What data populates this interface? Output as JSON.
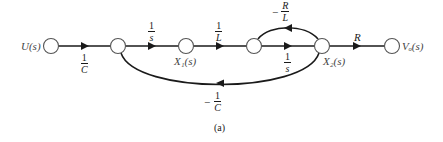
{
  "diagram": {
    "type": "signal-flow-graph",
    "caption": "(a)",
    "nodes": [
      {
        "id": "U",
        "label": "U(s)",
        "x": 51,
        "y": 46
      },
      {
        "id": "n2",
        "label": "",
        "x": 118,
        "y": 46
      },
      {
        "id": "X1",
        "label": "X₁(s)",
        "x": 186,
        "y": 46
      },
      {
        "id": "n4",
        "label": "",
        "x": 254,
        "y": 46
      },
      {
        "id": "X2",
        "label": "X₂(s)",
        "x": 322,
        "y": 46
      },
      {
        "id": "Vo",
        "label": "Vₒ(s)",
        "x": 392,
        "y": 46
      }
    ],
    "branches": [
      {
        "from": "U",
        "to": "n2",
        "gain": {
          "neg": "",
          "num": "1",
          "den": "C"
        }
      },
      {
        "from": "n2",
        "to": "X1",
        "gain": {
          "neg": "",
          "num": "1",
          "den": "s"
        }
      },
      {
        "from": "X1",
        "to": "n4",
        "gain": {
          "neg": "",
          "num": "1",
          "den": "L"
        }
      },
      {
        "from": "n4",
        "to": "X2",
        "gain": {
          "neg": "",
          "num": "1",
          "den": "s"
        }
      },
      {
        "from": "X2",
        "to": "n4",
        "gain": {
          "neg": "−",
          "num": "R",
          "den": "L"
        }
      },
      {
        "from": "X2",
        "to": "Vo",
        "gain": {
          "text": "R"
        }
      },
      {
        "from": "X2",
        "to": "n2",
        "gain": {
          "neg": "−",
          "num": "1",
          "den": "C"
        }
      }
    ]
  }
}
